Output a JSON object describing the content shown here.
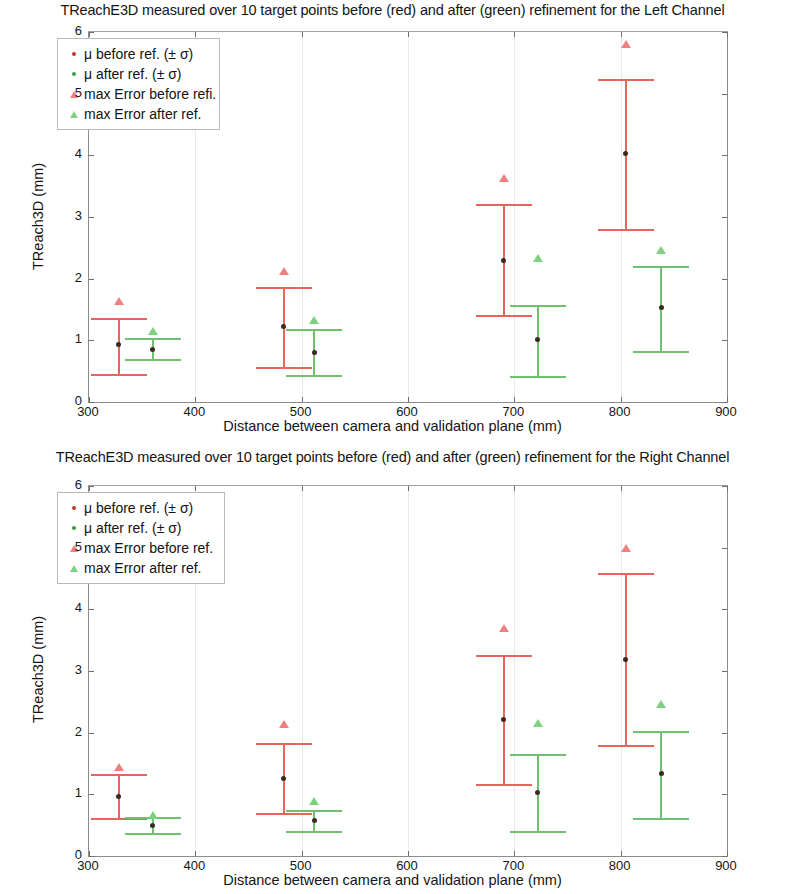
{
  "charts": [
    {
      "id": "left-channel",
      "title": "TReachE3D measured over 10 target points before (red) and after (green) refinement for the Left Channel",
      "xlabel": "Distance between camera and validation plane (mm)",
      "ylabel": "TReach3D (mm)",
      "xticks": [
        "300",
        "400",
        "500",
        "600",
        "700",
        "800",
        "900"
      ],
      "yticks": [
        "0",
        "1",
        "2",
        "3",
        "4",
        "5",
        "6"
      ],
      "legend": {
        "items": [
          {
            "label": "μ before ref. (± σ)",
            "marker": "dot",
            "color": "#c0392b"
          },
          {
            "label": "μ after ref. (± σ)",
            "marker": "dot",
            "color": "#3f9b3f"
          },
          {
            "label": "max Error before refi.",
            "marker": "triangle",
            "color": "#f08080"
          },
          {
            "label": "max Error after ref.",
            "marker": "triangle",
            "color": "#7ed17e"
          }
        ]
      }
    },
    {
      "id": "right-channel",
      "title": "TReachE3D measured over 10 target points before (red) and after (green) refinement for the Right Channel",
      "xlabel": "Distance between camera and validation plane (mm)",
      "ylabel": "TReach3D (mm)",
      "xticks": [
        "300",
        "400",
        "500",
        "600",
        "700",
        "800",
        "900"
      ],
      "yticks": [
        "0",
        "1",
        "2",
        "3",
        "4",
        "5",
        "6"
      ],
      "legend": {
        "items": [
          {
            "label": "μ before ref. (± σ)",
            "marker": "dot",
            "color": "#c0392b"
          },
          {
            "label": "μ after ref. (± σ)",
            "marker": "dot",
            "color": "#3f9b3f"
          },
          {
            "label": "max Error before ref.",
            "marker": "triangle",
            "color": "#f08080"
          },
          {
            "label": "max Error after ref.",
            "marker": "triangle",
            "color": "#7ed17e"
          }
        ]
      }
    }
  ],
  "chart_data": [
    {
      "type": "scatter",
      "id": "left-channel",
      "title": "TReachE3D measured over 10 target points before (red) and after (green) refinement for the Left Channel",
      "xlabel": "Distance between camera and validation plane (mm)",
      "ylabel": "TReach3D (mm)",
      "xlim": [
        300,
        900
      ],
      "ylim": [
        0,
        6
      ],
      "xticks": [
        300,
        400,
        500,
        600,
        700,
        800,
        900
      ],
      "yticks": [
        0,
        1,
        2,
        3,
        4,
        5,
        6
      ],
      "grid": "vertical-light",
      "legend_position": "upper-left",
      "series": [
        {
          "name": "μ before ref. (± σ)",
          "color": "#e8655e",
          "points": [
            {
              "x": 328,
              "mean": 0.93,
              "lower": 0.46,
              "upper": 1.37
            },
            {
              "x": 483,
              "mean": 1.23,
              "lower": 0.57,
              "upper": 1.86
            },
            {
              "x": 690,
              "mean": 2.3,
              "lower": 1.41,
              "upper": 3.21
            },
            {
              "x": 805,
              "mean": 4.03,
              "lower": 2.8,
              "upper": 5.23
            }
          ]
        },
        {
          "name": "μ after ref. (± σ)",
          "color": "#6fc06f",
          "points": [
            {
              "x": 360,
              "mean": 0.85,
              "lower": 0.7,
              "upper": 1.03
            },
            {
              "x": 512,
              "mean": 0.81,
              "lower": 0.43,
              "upper": 1.18
            },
            {
              "x": 722,
              "mean": 1.01,
              "lower": 0.42,
              "upper": 1.57
            },
            {
              "x": 838,
              "mean": 1.53,
              "lower": 0.83,
              "upper": 2.2
            }
          ]
        },
        {
          "name": "max Error before refi.",
          "color": "#f08080",
          "points": [
            {
              "x": 328,
              "y": 1.63
            },
            {
              "x": 483,
              "y": 2.13
            },
            {
              "x": 690,
              "y": 3.63
            },
            {
              "x": 805,
              "y": 5.8
            }
          ]
        },
        {
          "name": "max Error after ref.",
          "color": "#7ed17e",
          "points": [
            {
              "x": 360,
              "y": 1.15
            },
            {
              "x": 512,
              "y": 1.33
            },
            {
              "x": 722,
              "y": 2.34
            },
            {
              "x": 838,
              "y": 2.46
            }
          ]
        }
      ]
    },
    {
      "type": "scatter",
      "id": "right-channel",
      "title": "TReachE3D measured over 10 target points before (red) and after (green) refinement for the Right Channel",
      "xlabel": "Distance between camera and validation plane (mm)",
      "ylabel": "TReach3D (mm)",
      "xlim": [
        300,
        900
      ],
      "ylim": [
        0,
        6
      ],
      "xticks": [
        300,
        400,
        500,
        600,
        700,
        800,
        900
      ],
      "yticks": [
        0,
        1,
        2,
        3,
        4,
        5,
        6
      ],
      "grid": "vertical-light",
      "legend_position": "upper-left",
      "series": [
        {
          "name": "μ before ref. (± σ)",
          "color": "#e8655e",
          "points": [
            {
              "x": 328,
              "mean": 0.97,
              "lower": 0.62,
              "upper": 1.33
            },
            {
              "x": 483,
              "mean": 1.26,
              "lower": 0.7,
              "upper": 1.83
            },
            {
              "x": 690,
              "mean": 2.21,
              "lower": 1.16,
              "upper": 3.26
            },
            {
              "x": 805,
              "mean": 3.19,
              "lower": 1.8,
              "upper": 4.59
            }
          ]
        },
        {
          "name": "μ after ref. (± σ)",
          "color": "#6fc06f",
          "points": [
            {
              "x": 360,
              "mean": 0.5,
              "lower": 0.37,
              "upper": 0.63
            },
            {
              "x": 512,
              "mean": 0.58,
              "lower": 0.4,
              "upper": 0.75
            },
            {
              "x": 722,
              "mean": 1.03,
              "lower": 0.4,
              "upper": 1.66
            },
            {
              "x": 838,
              "mean": 1.33,
              "lower": 0.61,
              "upper": 2.03
            }
          ]
        },
        {
          "name": "max Error before ref.",
          "color": "#f08080",
          "points": [
            {
              "x": 328,
              "y": 1.45
            },
            {
              "x": 483,
              "y": 2.14
            },
            {
              "x": 690,
              "y": 3.7
            },
            {
              "x": 805,
              "y": 4.99
            }
          ]
        },
        {
          "name": "max Error after ref.",
          "color": "#7ed17e",
          "points": [
            {
              "x": 360,
              "y": 0.66
            },
            {
              "x": 512,
              "y": 0.89
            },
            {
              "x": 722,
              "y": 2.15
            },
            {
              "x": 838,
              "y": 2.47
            }
          ]
        }
      ]
    }
  ]
}
